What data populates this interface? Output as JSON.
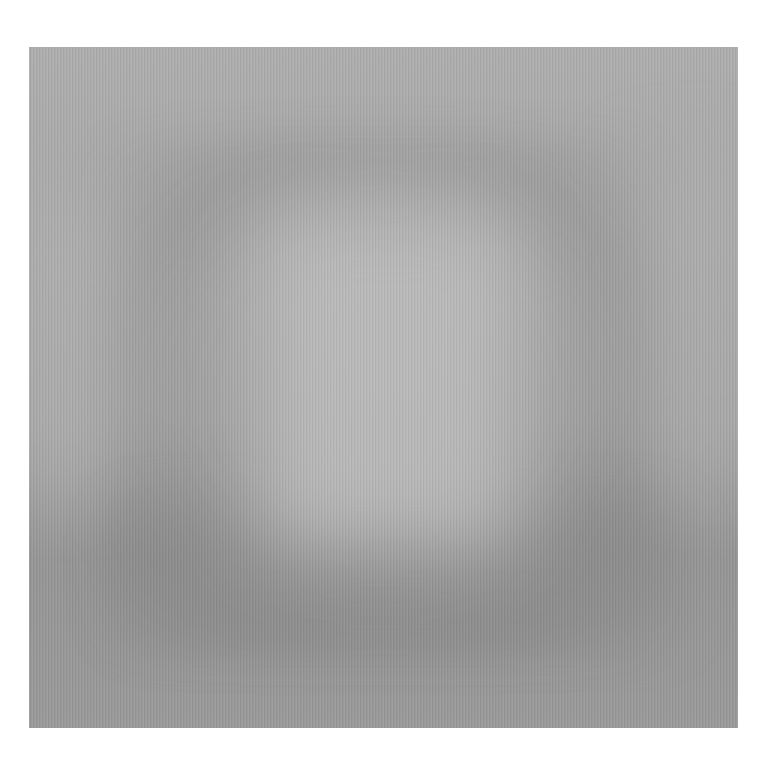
{
  "image": {
    "description": "Textured gray surface with a soft, blurred lighter rectangular area in the center",
    "colors": {
      "background": "#ffffff",
      "panel_base": "#a4a4a4",
      "highlight": "#bdbdbd",
      "shadow": "#8e8e8e"
    }
  }
}
